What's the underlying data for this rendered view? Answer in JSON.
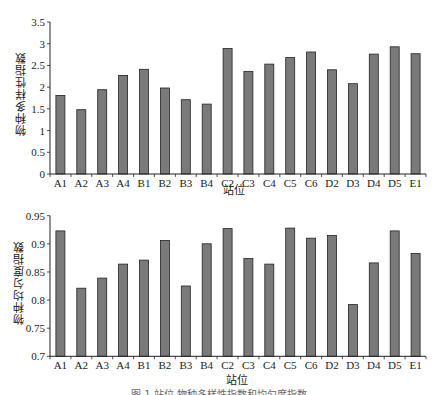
{
  "chart_data": [
    {
      "type": "bar",
      "title": "",
      "xlabel": "站位",
      "ylabel": "物种多样性指数",
      "ylim": [
        0,
        3.5
      ],
      "yticks": [
        0,
        0.5,
        1,
        1.5,
        2,
        2.5,
        3,
        3.5
      ],
      "ytick_labels": [
        "0",
        "0.5",
        "1",
        "1.5",
        "2",
        "2.5",
        "3",
        "3.5"
      ],
      "grid": false,
      "legend": null,
      "bar_color": "#7a7a7a",
      "categories": [
        "A1",
        "A2",
        "A3",
        "A4",
        "B1",
        "B2",
        "B3",
        "B4",
        "C2",
        "C3",
        "C4",
        "C5",
        "C6",
        "D2",
        "D3",
        "D4",
        "D5",
        "E1"
      ],
      "values": [
        1.81,
        1.48,
        1.94,
        2.27,
        2.41,
        1.98,
        1.71,
        1.61,
        2.89,
        2.36,
        2.53,
        2.68,
        2.81,
        2.4,
        2.08,
        2.76,
        2.93,
        2.77
      ]
    },
    {
      "type": "bar",
      "title": "",
      "xlabel": "站位",
      "ylabel": "物种均匀度指数",
      "ylim": [
        0.7,
        0.95
      ],
      "yticks": [
        0.7,
        0.75,
        0.8,
        0.85,
        0.9,
        0.95
      ],
      "ytick_labels": [
        "0.7",
        "0.75",
        "0.8",
        "0.85",
        "0.9",
        "0.95"
      ],
      "grid": false,
      "legend": null,
      "bar_color": "#7a7a7a",
      "categories": [
        "A1",
        "A2",
        "A3",
        "A4",
        "B1",
        "B2",
        "B3",
        "B4",
        "C2",
        "C3",
        "C4",
        "C5",
        "C6",
        "D2",
        "D3",
        "D4",
        "D5",
        "E1"
      ],
      "values": [
        0.923,
        0.821,
        0.839,
        0.864,
        0.871,
        0.906,
        0.825,
        0.9,
        0.927,
        0.874,
        0.864,
        0.928,
        0.91,
        0.915,
        0.792,
        0.866,
        0.923,
        0.883
      ]
    }
  ],
  "labels": {
    "top_ylabel": "物种多样性指数",
    "top_xlabel": "站位",
    "bottom_ylabel": "物种均匀度指数",
    "bottom_xlabel": "站位",
    "caption_partial": "图 1  站位 物种多样性指数和均匀度指数"
  }
}
